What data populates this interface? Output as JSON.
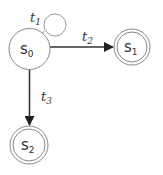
{
  "diagram": {
    "type": "state-transition",
    "states": [
      {
        "id": "s0",
        "label": "s",
        "sub": "0",
        "accepting": false,
        "cx": 29.5,
        "cy": 49,
        "r": 20.5
      },
      {
        "id": "s1",
        "label": "s",
        "sub": "1",
        "accepting": true,
        "cx": 132,
        "cy": 47,
        "r": 18
      },
      {
        "id": "s2",
        "label": "s",
        "sub": "2",
        "accepting": true,
        "cx": 29,
        "cy": 145,
        "r": 19
      }
    ],
    "transitions": [
      {
        "id": "t1",
        "label": "t",
        "sub": "1",
        "from": "s0",
        "to": "s0"
      },
      {
        "id": "t2",
        "label": "t",
        "sub": "2",
        "from": "s0",
        "to": "s1"
      },
      {
        "id": "t3",
        "label": "t",
        "sub": "3",
        "from": "s0",
        "to": "s2"
      }
    ],
    "colors": {
      "stroke": "#333333",
      "state_stroke": "#888888",
      "background": "#ffffff"
    }
  }
}
